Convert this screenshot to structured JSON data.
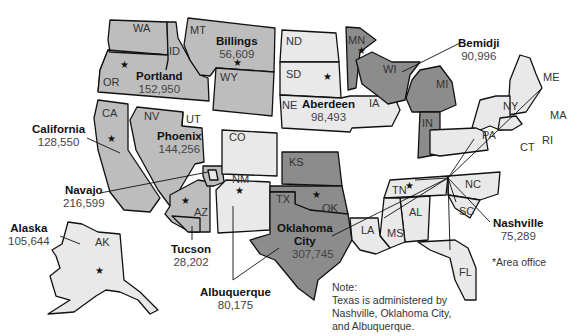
{
  "map": {
    "title_implied": "Indian Health Service Areas",
    "colors": {
      "medium": "#bdbdbd",
      "light": "#e9e9e9",
      "dark": "#8c8c8c",
      "stroke": "#111111"
    },
    "areas": [
      {
        "id": "portland",
        "name": "Portland",
        "value": "152,950",
        "states": [
          "WA",
          "OR",
          "ID"
        ],
        "shade": "medium"
      },
      {
        "id": "billings",
        "name": "Billings",
        "value": "56,609",
        "states": [
          "MT",
          "WY"
        ],
        "shade": "medium"
      },
      {
        "id": "aberdeen",
        "name": "Aberdeen",
        "value": "98,493",
        "states": [
          "ND",
          "SD",
          "NE",
          "IA"
        ],
        "shade": "light"
      },
      {
        "id": "bemidji",
        "name": "Bemidji",
        "value": "90,996",
        "states": [
          "MN",
          "WI",
          "MI",
          "IN"
        ],
        "shade": "dark"
      },
      {
        "id": "california",
        "name": "California",
        "value": "128,550",
        "states": [
          "CA"
        ],
        "shade": "medium"
      },
      {
        "id": "phoenix",
        "name": "Phoenix",
        "value": "144,256",
        "states": [
          "NV",
          "UT",
          "AZ"
        ],
        "shade": "medium"
      },
      {
        "id": "navajo",
        "name": "Navajo",
        "value": "216,599",
        "states": [
          "AZ/NM/UT Four Corners"
        ],
        "shade": "medium"
      },
      {
        "id": "tucson",
        "name": "Tucson",
        "value": "28,202",
        "states": [
          "AZ"
        ],
        "shade": "medium"
      },
      {
        "id": "albuquerque",
        "name": "Albuquerque",
        "value": "80,175",
        "states": [
          "CO",
          "NM",
          "TX"
        ],
        "shade": "light"
      },
      {
        "id": "oklahoma",
        "name": "Oklahoma City",
        "name_line1": "Oklahoma",
        "name_line2": "City",
        "value": "307,745",
        "states": [
          "KS",
          "OK",
          "TX"
        ],
        "shade": "dark"
      },
      {
        "id": "nashville",
        "name": "Nashville",
        "value": "75,289",
        "states": [
          "ME",
          "NY",
          "MA",
          "CT",
          "RI",
          "PA",
          "NC",
          "SC",
          "TN",
          "AL",
          "MS",
          "LA",
          "FL"
        ],
        "shade": "light"
      },
      {
        "id": "alaska",
        "name": "Alaska",
        "value": "105,644",
        "states": [
          "AK"
        ],
        "shade": "light"
      }
    ],
    "state_labels": [
      "WA",
      "ID",
      "MT",
      "OR",
      "WY",
      "ND",
      "SD",
      "NE",
      "IA",
      "MN",
      "WI",
      "MI",
      "IN",
      "NY",
      "ME",
      "MA",
      "RI",
      "CT",
      "PA",
      "CA",
      "NV",
      "UT",
      "CO",
      "KS",
      "NM",
      "AZ",
      "OK",
      "TX",
      "TN",
      "NC",
      "SC",
      "AL",
      "MS",
      "LA",
      "FL",
      "AK"
    ],
    "legend": {
      "symbol": "*",
      "label": "Area office"
    },
    "note": {
      "line1": "Note:",
      "line2": "Texas is administered by",
      "line3": "Nashville, Oklahoma City,",
      "line4": "and Albuquerque."
    }
  }
}
